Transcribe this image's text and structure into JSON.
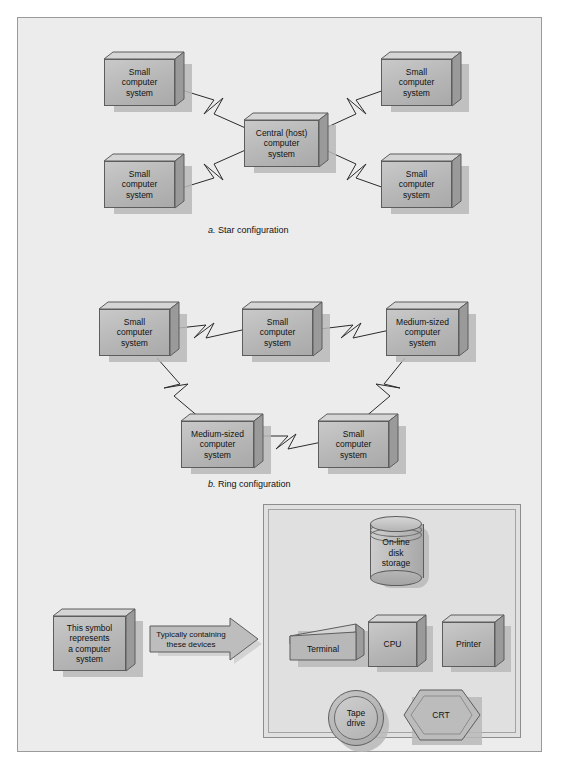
{
  "figure": {
    "sections": [
      {
        "id": "star",
        "caption_letter": "a.",
        "caption_text": "Star configuration",
        "nodes": [
          {
            "id": "star-tl",
            "label": "Small\ncomputer\nsystem",
            "label_lines": [
              "Small",
              "computer",
              "system"
            ]
          },
          {
            "id": "star-tr",
            "label": "Small\ncomputer\nsystem",
            "label_lines": [
              "Small",
              "computer",
              "system"
            ]
          },
          {
            "id": "star-center",
            "label": "Central (host)\ncomputer\nsystem",
            "label_lines": [
              "Central (host)",
              "computer",
              "system"
            ]
          },
          {
            "id": "star-bl",
            "label": "Small\ncomputer\nsystem",
            "label_lines": [
              "Small",
              "computer",
              "system"
            ]
          },
          {
            "id": "star-br",
            "label": "Small\ncomputer\nsystem",
            "label_lines": [
              "Small",
              "computer",
              "system"
            ]
          }
        ]
      },
      {
        "id": "ring",
        "caption_letter": "b.",
        "caption_text": "Ring configuration",
        "nodes": [
          {
            "id": "ring-tl",
            "label_lines": [
              "Small",
              "computer",
              "system"
            ]
          },
          {
            "id": "ring-tc",
            "label_lines": [
              "Small",
              "computer",
              "system"
            ]
          },
          {
            "id": "ring-tr",
            "label_lines": [
              "Medium-sized",
              "computer",
              "system"
            ]
          },
          {
            "id": "ring-bl",
            "label_lines": [
              "Medium-sized",
              "computer",
              "system"
            ]
          },
          {
            "id": "ring-br",
            "label_lines": [
              "Small",
              "computer",
              "system"
            ]
          }
        ]
      }
    ],
    "legend": {
      "symbol_box_lines": [
        "This symbol",
        "represents",
        "a computer",
        "system"
      ],
      "arrow_lines": [
        "Typically containing",
        "these devices"
      ]
    },
    "panel": {
      "devices": [
        {
          "id": "disk",
          "shape": "cylinder",
          "label_lines": [
            "On-line",
            "disk",
            "storage"
          ]
        },
        {
          "id": "terminal",
          "shape": "slab",
          "label_lines": [
            "Terminal"
          ]
        },
        {
          "id": "cpu",
          "shape": "box3d",
          "label_lines": [
            "CPU"
          ]
        },
        {
          "id": "printer",
          "shape": "box3d",
          "label_lines": [
            "Printer"
          ]
        },
        {
          "id": "tape",
          "shape": "circle",
          "label_lines": [
            "Tape",
            "drive"
          ]
        },
        {
          "id": "crt",
          "shape": "hexagon",
          "label_lines": [
            "CRT"
          ]
        }
      ]
    },
    "colors": {
      "page_background": "#ffffff",
      "frame_background": "#ececec",
      "frame_border": "#9a9a9a",
      "box_fill": "#b6b6b6",
      "box_border": "#5d5d5d",
      "line": "#2b2b2b",
      "panel_background": "#e0e0e0",
      "shadow": "#b9b9b9"
    }
  }
}
